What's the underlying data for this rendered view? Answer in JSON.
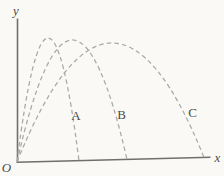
{
  "figure": {
    "background": "#faf9f6",
    "axis_color": "#6f6f6f",
    "curve_color": "#a9a9a9",
    "text_color": "#4a4a4a"
  },
  "chart_data": {
    "type": "line",
    "title": "",
    "xlabel": "x",
    "ylabel": "y",
    "origin_label": "O",
    "grid": false,
    "legend": "none",
    "line_style": "dashed",
    "axes": {
      "origin_px": [
        17,
        162
      ],
      "x_axis_end_px": [
        211,
        157
      ],
      "y_axis_top_px": [
        17,
        18
      ],
      "ticks": "none",
      "arrowheads": "none"
    },
    "curves": [
      {
        "label": "A",
        "start": [
          17,
          162
        ],
        "peak": [
          48,
          38
        ],
        "end": [
          79,
          161
        ]
      },
      {
        "label": "B",
        "start": [
          17,
          162
        ],
        "peak": [
          72,
          40
        ],
        "end": [
          127,
          159.5
        ]
      },
      {
        "label": "C",
        "start": [
          17,
          162
        ],
        "peak": [
          111,
          43
        ],
        "end": [
          204,
          157.5
        ]
      }
    ]
  }
}
